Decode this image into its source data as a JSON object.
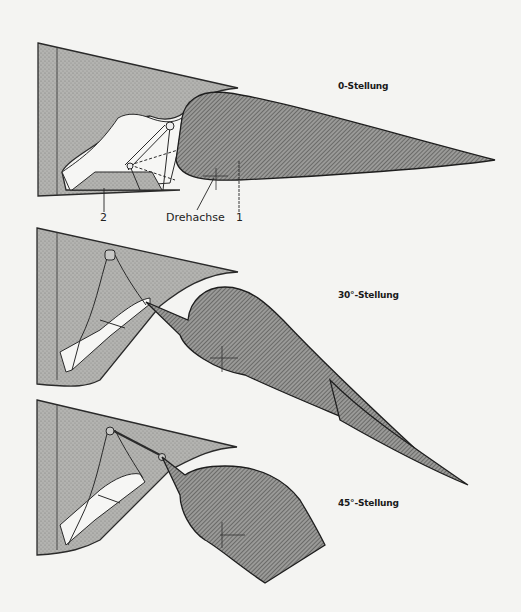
{
  "diagram": {
    "positions": [
      {
        "label": "0-Stellung",
        "angle_deg": 0
      },
      {
        "label": "30°-Stellung",
        "angle_deg": 30
      },
      {
        "label": "45°-Stellung",
        "angle_deg": 45
      }
    ],
    "callouts": {
      "pivot": "Drehachse",
      "part_1": "1",
      "part_2": "2"
    },
    "colors": {
      "background": "#f4f4f2",
      "fixed_structure_fill": "#a9a9a6",
      "moving_surface_fill": "#8e8e8c",
      "outline": "#2a2a2a",
      "cavity": "#f6f6f4"
    }
  }
}
